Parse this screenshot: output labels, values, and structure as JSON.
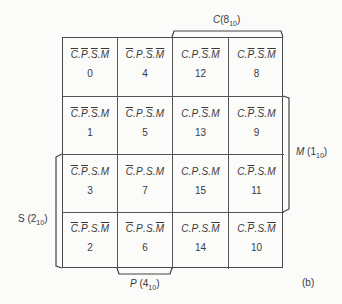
{
  "figure_label": "(b)",
  "groups": {
    "C": {
      "var": "C",
      "value": "8",
      "base": "10"
    },
    "M": {
      "var": "M",
      "value": "1",
      "base": "10"
    },
    "S": {
      "var": "S",
      "value": "2",
      "base": "10"
    },
    "P": {
      "var": "P",
      "value": "4",
      "base": "10"
    }
  },
  "cells": [
    [
      {
        "vars": [
          [
            "C",
            true
          ],
          [
            "P",
            true
          ],
          [
            "S",
            true
          ],
          [
            "M",
            true
          ]
        ],
        "minterm": "0"
      },
      {
        "vars": [
          [
            "C",
            true
          ],
          [
            "P",
            false
          ],
          [
            "S",
            true
          ],
          [
            "M",
            true
          ]
        ],
        "minterm": "4"
      },
      {
        "vars": [
          [
            "C",
            false
          ],
          [
            "P",
            false
          ],
          [
            "S",
            true
          ],
          [
            "M",
            true
          ]
        ],
        "minterm": "12"
      },
      {
        "vars": [
          [
            "C",
            false
          ],
          [
            "P",
            true
          ],
          [
            "S",
            true
          ],
          [
            "M",
            true
          ]
        ],
        "minterm": "8"
      }
    ],
    [
      {
        "vars": [
          [
            "C",
            true
          ],
          [
            "P",
            true
          ],
          [
            "S",
            true
          ],
          [
            "M",
            false
          ]
        ],
        "minterm": "1"
      },
      {
        "vars": [
          [
            "C",
            true
          ],
          [
            "P",
            false
          ],
          [
            "S",
            true
          ],
          [
            "M",
            false
          ]
        ],
        "minterm": "5"
      },
      {
        "vars": [
          [
            "C",
            false
          ],
          [
            "P",
            false
          ],
          [
            "S",
            true
          ],
          [
            "M",
            false
          ]
        ],
        "minterm": "13"
      },
      {
        "vars": [
          [
            "C",
            false
          ],
          [
            "P",
            true
          ],
          [
            "S",
            true
          ],
          [
            "M",
            false
          ]
        ],
        "minterm": "9"
      }
    ],
    [
      {
        "vars": [
          [
            "C",
            true
          ],
          [
            "P",
            true
          ],
          [
            "S",
            false
          ],
          [
            "M",
            false
          ]
        ],
        "minterm": "3"
      },
      {
        "vars": [
          [
            "C",
            true
          ],
          [
            "P",
            false
          ],
          [
            "S",
            false
          ],
          [
            "M",
            false
          ]
        ],
        "minterm": "7"
      },
      {
        "vars": [
          [
            "C",
            false
          ],
          [
            "P",
            false
          ],
          [
            "S",
            false
          ],
          [
            "M",
            false
          ]
        ],
        "minterm": "15"
      },
      {
        "vars": [
          [
            "C",
            false
          ],
          [
            "P",
            true
          ],
          [
            "S",
            false
          ],
          [
            "M",
            false
          ]
        ],
        "minterm": "11"
      }
    ],
    [
      {
        "vars": [
          [
            "C",
            true
          ],
          [
            "P",
            true
          ],
          [
            "S",
            false
          ],
          [
            "M",
            true
          ]
        ],
        "minterm": "2"
      },
      {
        "vars": [
          [
            "C",
            true
          ],
          [
            "P",
            false
          ],
          [
            "S",
            false
          ],
          [
            "M",
            true
          ]
        ],
        "minterm": "6"
      },
      {
        "vars": [
          [
            "C",
            false
          ],
          [
            "P",
            false
          ],
          [
            "S",
            false
          ],
          [
            "M",
            true
          ]
        ],
        "minterm": "14"
      },
      {
        "vars": [
          [
            "C",
            false
          ],
          [
            "P",
            true
          ],
          [
            "S",
            false
          ],
          [
            "M",
            true
          ]
        ],
        "minterm": "10"
      }
    ]
  ]
}
